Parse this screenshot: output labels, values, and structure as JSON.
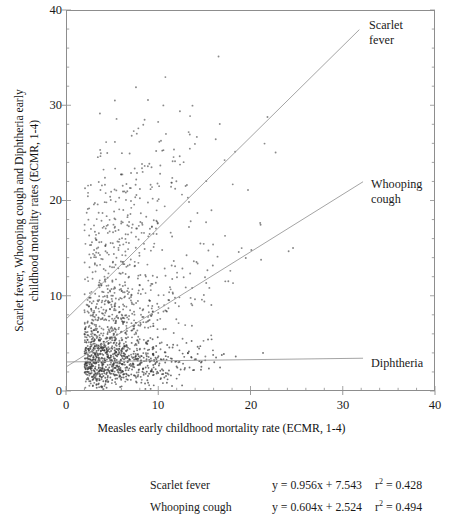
{
  "chart_data": {
    "type": "scatter",
    "title": "",
    "xlabel": "Measles early childhood mortality rate (ECMR, 1-4)",
    "ylabel_line1": "Scarlet fever, Whooping cough and Diphtheria early",
    "ylabel_line2": "childhood mortality rates (ECMR, 1-4)",
    "xlim": [
      0,
      40
    ],
    "ylim": [
      0,
      40
    ],
    "xticks": [
      0,
      10,
      20,
      30,
      40
    ],
    "yticks": [
      0,
      10,
      20,
      30,
      40
    ],
    "xtick_labels": [
      "0",
      "10",
      "20",
      "30",
      "40"
    ],
    "ytick_labels": [
      "0",
      "10",
      "20",
      "30",
      "40"
    ],
    "minor_tick_interval": 2,
    "grid": false,
    "legend_position": "below-plot",
    "point_marker": "dot",
    "point_color": "#3a3a3a",
    "line_color": "#9a9a9a",
    "axis_color": "#8d8d8d",
    "annotations": [
      {
        "name": "scarlet-fever",
        "label_line1": "Scarlet",
        "label_line2": "fever"
      },
      {
        "name": "whooping-cough",
        "label_line1": "Whooping",
        "label_line2": "cough"
      },
      {
        "name": "diphtheria",
        "label_line1": "Diphtheria",
        "label_line2": ""
      }
    ],
    "series": [
      {
        "name": "Scarlet fever",
        "slope": 0.956,
        "intercept": 7.543,
        "r2": 0.428,
        "equation": "y = 0.956x + 7.543",
        "r2_text": "= 0.428",
        "fit_x": [
          0,
          31.8
        ],
        "fit_y": [
          7.543,
          37.94
        ]
      },
      {
        "name": "Whooping cough",
        "slope": 0.604,
        "intercept": 2.524,
        "r2": 0.494,
        "equation": "y = 0.604x + 2.524",
        "r2_text": "= 0.494",
        "fit_x": [
          0,
          32.2
        ],
        "fit_y": [
          2.524,
          21.97
        ]
      },
      {
        "name": "Diphtheria",
        "slope": 0.012,
        "intercept": 3.05,
        "r2": null,
        "equation": "",
        "r2_text": "",
        "fit_x": [
          0,
          32.2
        ],
        "fit_y": [
          3.05,
          3.44
        ]
      }
    ],
    "legend_rows": [
      {
        "name": "Scarlet fever",
        "equation": "y = 0.956x + 7.543",
        "r2_prefix": "r",
        "r2_sup": "2",
        "r2_value": "= 0.428"
      },
      {
        "name": "Whooping  cough",
        "equation": "y = 0.604x + 2.524",
        "r2_prefix": "r",
        "r2_sup": "2",
        "r2_value": "= 0.494"
      }
    ]
  }
}
